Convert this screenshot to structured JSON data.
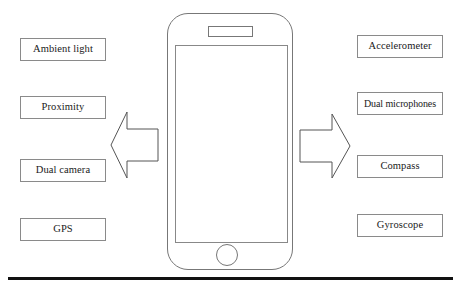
{
  "diagram": {
    "left_column": {
      "arrow_icon": "arrow-left-icon",
      "sensors": [
        {
          "label": "Ambient light"
        },
        {
          "label": "Proximity"
        },
        {
          "label": "Dual camera"
        },
        {
          "label": "GPS"
        }
      ]
    },
    "right_column": {
      "arrow_icon": "arrow-right-icon",
      "sensors": [
        {
          "label": "Accelerometer"
        },
        {
          "label": "Dual microphones"
        },
        {
          "label": "Compass"
        },
        {
          "label": "Gyroscope"
        }
      ]
    },
    "device": {
      "name": "smartphone-illustration",
      "parts": {
        "body": "phone-body",
        "speaker": "earpiece-speaker-slot",
        "screen": "phone-screen",
        "home_button": "home-button"
      }
    },
    "rule": {
      "name": "bottom-divider"
    },
    "colors": {
      "background": "#ffffff",
      "box_border": "#8a8a8a",
      "device_outline": "#777777",
      "arrow_outline": "#555555",
      "rule": "#111111",
      "text": "#1a1a1a"
    }
  }
}
